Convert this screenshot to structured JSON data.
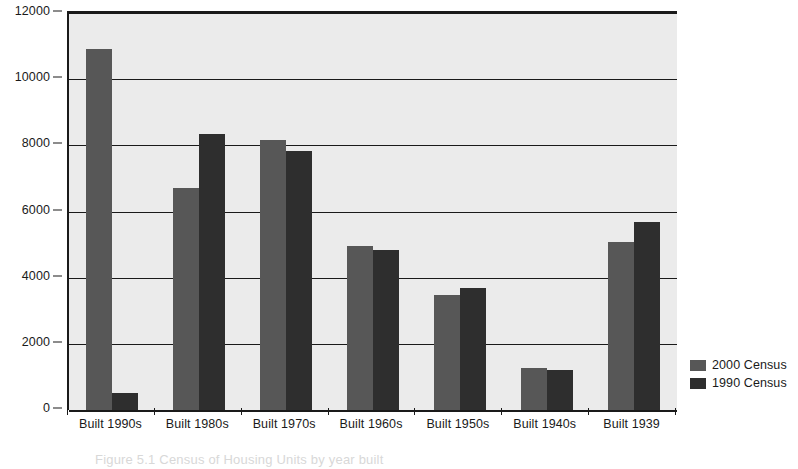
{
  "chart_data": {
    "type": "bar",
    "title": "",
    "subtitle": "",
    "xlabel": "",
    "ylabel": "",
    "ylim": [
      0,
      12000
    ],
    "ytick_labels": [
      "0",
      "2000",
      "4000",
      "6000",
      "8000",
      "10000",
      "12000"
    ],
    "ytick_values": [
      0,
      2000,
      4000,
      6000,
      8000,
      10000,
      12000
    ],
    "grid": true,
    "legend_position": "right",
    "categories": [
      "Built 1990s",
      "Built 1980s",
      "Built 1970s",
      "Built 1960s",
      "Built 1950s",
      "Built 1940s",
      "Built 1939"
    ],
    "series": [
      {
        "name": "2000 Census",
        "color": "#575757",
        "values": [
          10900,
          6700,
          8150,
          4950,
          3480,
          1280,
          5070
        ]
      },
      {
        "name": "1990 Census",
        "color": "#2e2e2e",
        "values": [
          520,
          8340,
          7840,
          4840,
          3700,
          1200,
          5680
        ]
      }
    ]
  },
  "legend": {
    "items": [
      {
        "label": "2000 Census"
      },
      {
        "label": "1990 Census"
      }
    ]
  },
  "caption": {
    "text": "Figure 5.1   Census of Housing Units by year built"
  },
  "colors": {
    "plot_background": "#ebebeb",
    "axis": "#1a1a1a",
    "series_2000": "#575757",
    "series_1990": "#2e2e2e"
  }
}
